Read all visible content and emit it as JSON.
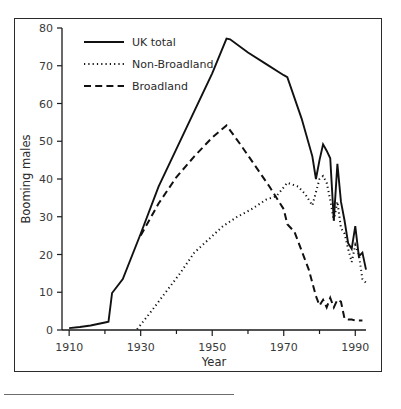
{
  "figure": {
    "background": "#ffffff",
    "frame_color": "#2b2b2b",
    "line_color": "#111111"
  },
  "axes": {
    "xlabel": "Year",
    "ylabel": "Booming males",
    "x_ticklabels": [
      "1910",
      "1930",
      "1950",
      "1970",
      "1990"
    ],
    "y_ticklabels": [
      "0",
      "10",
      "20",
      "30",
      "40",
      "50",
      "60",
      "70",
      "80"
    ]
  },
  "legend": {
    "items": [
      {
        "label": "UK total",
        "style": "solid"
      },
      {
        "label": "Non-Broadland",
        "style": "dotted"
      },
      {
        "label": "Broadland",
        "style": "dashed"
      }
    ]
  },
  "chart_data": {
    "type": "line",
    "title": "",
    "xlabel": "Year",
    "ylabel": "Booming males",
    "xlim": [
      1908,
      1993
    ],
    "ylim": [
      0,
      80
    ],
    "xticks": [
      1910,
      1930,
      1950,
      1970,
      1990
    ],
    "xminorticks": [
      1920,
      1940,
      1960,
      1980
    ],
    "yticks": [
      0,
      10,
      20,
      30,
      40,
      50,
      60,
      70,
      80
    ],
    "grid": false,
    "legend_position": "top-left",
    "series": [
      {
        "name": "UK total",
        "style": "solid",
        "points": [
          [
            1910,
            0.5
          ],
          [
            1913,
            0.8
          ],
          [
            1916,
            1.2
          ],
          [
            1920,
            2.0
          ],
          [
            1921,
            2.2
          ],
          [
            1922,
            9.8
          ],
          [
            1925,
            13.5
          ],
          [
            1930,
            25.5
          ],
          [
            1935,
            38.0
          ],
          [
            1940,
            48.0
          ],
          [
            1945,
            58.0
          ],
          [
            1950,
            68.0
          ],
          [
            1954,
            77.2
          ],
          [
            1955,
            77.0
          ],
          [
            1960,
            73.5
          ],
          [
            1965,
            70.5
          ],
          [
            1970,
            67.5
          ],
          [
            1971,
            67.0
          ],
          [
            1975,
            56.0
          ],
          [
            1978,
            46.0
          ],
          [
            1979,
            40.0
          ],
          [
            1980,
            45.0
          ],
          [
            1981,
            49.2
          ],
          [
            1982,
            47.5
          ],
          [
            1983,
            45.5
          ],
          [
            1984,
            29.0
          ],
          [
            1985,
            44.0
          ],
          [
            1986,
            34.0
          ],
          [
            1987,
            29.0
          ],
          [
            1988,
            23.0
          ],
          [
            1989,
            21.5
          ],
          [
            1990,
            27.5
          ],
          [
            1991,
            19.5
          ],
          [
            1992,
            20.5
          ],
          [
            1993,
            16.0
          ]
        ]
      },
      {
        "name": "Broadland",
        "style": "dashed",
        "points": [
          [
            1930,
            25.0
          ],
          [
            1935,
            33.5
          ],
          [
            1940,
            40.5
          ],
          [
            1945,
            46.0
          ],
          [
            1950,
            51.0
          ],
          [
            1954,
            54.2
          ],
          [
            1958,
            49.0
          ],
          [
            1962,
            43.5
          ],
          [
            1966,
            38.0
          ],
          [
            1970,
            32.0
          ],
          [
            1971,
            28.0
          ],
          [
            1973,
            26.0
          ],
          [
            1975,
            21.0
          ],
          [
            1977,
            16.0
          ],
          [
            1979,
            9.0
          ],
          [
            1980,
            6.5
          ],
          [
            1981,
            8.0
          ],
          [
            1982,
            6.0
          ],
          [
            1983,
            8.5
          ],
          [
            1984,
            6.0
          ],
          [
            1985,
            8.0
          ],
          [
            1986,
            7.5
          ],
          [
            1987,
            3.0
          ],
          [
            1988,
            2.8
          ],
          [
            1989,
            2.8
          ],
          [
            1990,
            2.5
          ],
          [
            1991,
            2.5
          ],
          [
            1992,
            2.5
          ]
        ]
      },
      {
        "name": "Non-Broadland",
        "style": "dotted",
        "points": [
          [
            1929,
            0.2
          ],
          [
            1933,
            5.0
          ],
          [
            1937,
            10.0
          ],
          [
            1941,
            15.0
          ],
          [
            1945,
            20.5
          ],
          [
            1949,
            24.0
          ],
          [
            1953,
            27.5
          ],
          [
            1957,
            30.0
          ],
          [
            1961,
            32.0
          ],
          [
            1965,
            34.5
          ],
          [
            1968,
            35.5
          ],
          [
            1971,
            39.0
          ],
          [
            1974,
            38.0
          ],
          [
            1976,
            36.0
          ],
          [
            1978,
            33.0
          ],
          [
            1979,
            36.5
          ],
          [
            1980,
            40.0
          ],
          [
            1981,
            40.8
          ],
          [
            1982,
            39.0
          ],
          [
            1983,
            34.5
          ],
          [
            1984,
            29.0
          ],
          [
            1985,
            34.0
          ],
          [
            1986,
            27.0
          ],
          [
            1987,
            25.5
          ],
          [
            1988,
            21.5
          ],
          [
            1989,
            18.0
          ],
          [
            1990,
            22.5
          ],
          [
            1991,
            20.0
          ],
          [
            1992,
            13.5
          ],
          [
            1993,
            12.5
          ]
        ]
      }
    ]
  }
}
